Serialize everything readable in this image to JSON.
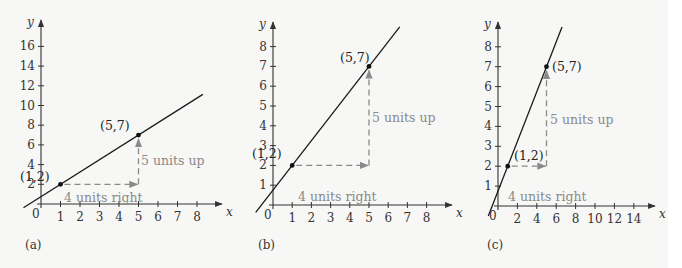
{
  "chart_data": [
    {
      "type": "line",
      "panel_label": "(a)",
      "xlabel": "x",
      "ylabel": "y",
      "x_ticks": [
        1,
        2,
        3,
        4,
        5,
        6,
        7,
        8
      ],
      "y_ticks": [
        2,
        4,
        6,
        8,
        10,
        12,
        14,
        16
      ],
      "origin_label": "0",
      "xlim": [
        0,
        9
      ],
      "ylim": [
        0,
        18
      ],
      "grid": false,
      "series": [
        {
          "name": "line",
          "slope": 1.25,
          "intercept": 0.75,
          "x_range": [
            -0.9,
            8.3
          ]
        }
      ],
      "points": [
        {
          "x": 1,
          "y": 2,
          "label": "(1,2)"
        },
        {
          "x": 5,
          "y": 7,
          "label": "(5,7)"
        }
      ],
      "annotations": {
        "run": "4 units right",
        "rise": "5 units up"
      }
    },
    {
      "type": "line",
      "panel_label": "(b)",
      "xlabel": "x",
      "ylabel": "y",
      "x_ticks": [
        1,
        2,
        3,
        4,
        5,
        6,
        7,
        8
      ],
      "y_ticks": [
        1,
        2,
        3,
        4,
        5,
        6,
        7,
        8
      ],
      "origin_label": "0",
      "xlim": [
        0,
        9
      ],
      "ylim": [
        0,
        9
      ],
      "grid": false,
      "series": [
        {
          "name": "line",
          "slope": 1.25,
          "intercept": 0.75,
          "x_range": [
            -0.9,
            6.6
          ]
        }
      ],
      "points": [
        {
          "x": 1,
          "y": 2,
          "label": "(1,2)"
        },
        {
          "x": 5,
          "y": 7,
          "label": "(5,7)"
        }
      ],
      "annotations": {
        "run": "4 units right",
        "rise": "5 units up"
      }
    },
    {
      "type": "line",
      "panel_label": "(c)",
      "xlabel": "x",
      "ylabel": "y",
      "x_ticks": [
        2,
        4,
        6,
        8,
        10,
        12,
        14
      ],
      "y_ticks": [
        1,
        2,
        3,
        4,
        5,
        6,
        7,
        8
      ],
      "origin_label": "0",
      "xlim": [
        0,
        16
      ],
      "ylim": [
        0,
        9
      ],
      "grid": false,
      "series": [
        {
          "name": "line",
          "slope": 1.25,
          "intercept": 0.75,
          "x_range": [
            -1.0,
            6.6
          ]
        }
      ],
      "points": [
        {
          "x": 1,
          "y": 2,
          "label": "(1,2)"
        },
        {
          "x": 5,
          "y": 7,
          "label": "(5,7)"
        }
      ],
      "annotations": {
        "run": "4 units right",
        "rise": "5 units up"
      }
    }
  ],
  "colors": {
    "axis": "#333333",
    "line": "#1a1a1a",
    "annotation": "#8a8a8a",
    "point": "#111111"
  }
}
